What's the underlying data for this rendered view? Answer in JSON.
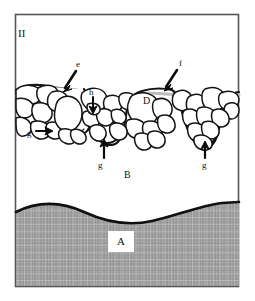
{
  "figure": {
    "panel_label": "II",
    "border_color": "#55555a",
    "background_color": "#ffffff",
    "tissue_color": "#9a9a9a",
    "outline_color": "#1a1a1a",
    "membrane_color": "#b9b9b9",
    "labels": [
      {
        "id": "panel",
        "text": "II",
        "x": 18,
        "y": 28,
        "style": "lbl-roman"
      },
      {
        "id": "e",
        "text": "e",
        "x": 76,
        "y": 67,
        "style": "lbl-small"
      },
      {
        "id": "f",
        "text": "f",
        "x": 179,
        "y": 66,
        "style": "lbl-small"
      },
      {
        "id": "h",
        "text": "h",
        "x": 89,
        "y": 94,
        "style": "lbl-small"
      },
      {
        "id": "D",
        "text": "D",
        "x": 143,
        "y": 100,
        "style": "lbl-cap"
      },
      {
        "id": "g-left",
        "text": "g",
        "x": 27,
        "y": 134,
        "style": "lbl-small"
      },
      {
        "id": "g-mid",
        "text": "g",
        "x": 97,
        "y": 166,
        "style": "lbl-small"
      },
      {
        "id": "g-right",
        "text": "g",
        "x": 201,
        "y": 166,
        "style": "lbl-small"
      },
      {
        "id": "B",
        "text": "B",
        "x": 124,
        "y": 173,
        "style": "lbl-cap"
      }
    ],
    "boxed_label": {
      "id": "A",
      "text": "A",
      "x": 113,
      "y": 237
    },
    "arrows": [
      {
        "id": "arrow-e",
        "label": "e",
        "points_to": "epithelial-invagination-left"
      },
      {
        "id": "arrow-f",
        "label": "f",
        "points_to": "epithelial-surface-right"
      },
      {
        "id": "arrow-h",
        "label": "h",
        "points_to": "small-cell-cluster"
      },
      {
        "id": "arrow-g-left",
        "label": "g",
        "points_to": "basal-cell-left"
      },
      {
        "id": "arrow-g-mid",
        "label": "g",
        "points_to": "basal-cell-middle"
      },
      {
        "id": "arrow-g-right",
        "label": "g",
        "points_to": "basal-cell-right"
      }
    ],
    "regions": [
      {
        "id": "A",
        "name": "lower-textured-zone"
      },
      {
        "id": "B",
        "name": "clear-middle-zone"
      },
      {
        "id": "D",
        "name": "cell-mass-region"
      }
    ]
  }
}
